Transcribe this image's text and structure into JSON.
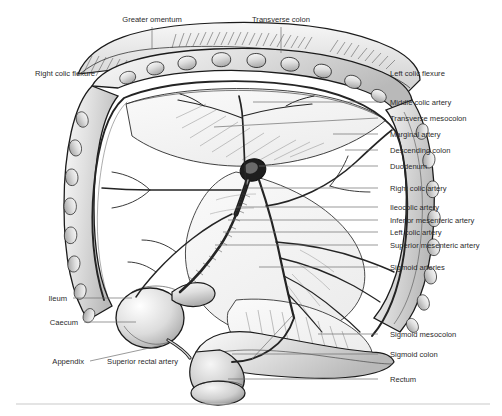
{
  "figure": {
    "type": "anatomical-illustration",
    "style": "black-and-white line drawing with grey wash shading",
    "footer_rule": true
  },
  "labels": {
    "top": [
      {
        "id": "greater-omentum",
        "text": "Greater omentum",
        "x": 152,
        "y": 22,
        "leader": {
          "x1": 152,
          "y1": 27,
          "x2": 152,
          "y2": 49
        }
      },
      {
        "id": "transverse-colon",
        "text": "Transverse colon",
        "x": 281,
        "y": 22,
        "leader": {
          "x1": 281,
          "y1": 27,
          "x2": 281,
          "y2": 53
        }
      }
    ],
    "left": [
      {
        "id": "right-colic-flexure",
        "text": "Right colic flexure",
        "x": 95,
        "y": 76,
        "leader": null
      },
      {
        "id": "ileum",
        "text": "Ileum",
        "x": 67,
        "y": 301,
        "leader": {
          "x1": 73,
          "y1": 298,
          "x2": 132,
          "y2": 298
        }
      },
      {
        "id": "caecum",
        "text": "Caecum",
        "x": 78,
        "y": 325,
        "leader": {
          "x1": 84,
          "y1": 322,
          "x2": 136,
          "y2": 322
        }
      },
      {
        "id": "appendix",
        "text": "Appendix",
        "x": 84,
        "y": 364,
        "leader": {
          "x1": 90,
          "y1": 361,
          "x2": 163,
          "y2": 345
        }
      },
      {
        "id": "superior-rectal-artery",
        "text": "Superior rectal artery",
        "x": 178,
        "y": 364,
        "leader": {
          "x1": 252,
          "y1": 359,
          "x2": 292,
          "y2": 316
        }
      }
    ],
    "right": [
      {
        "id": "left-colic-flexure",
        "text": "Left colic flexure",
        "x": 390,
        "y": 76,
        "leader": null
      },
      {
        "id": "middle-colic-artery",
        "text": "Middle colic artery",
        "x": 390,
        "y": 105,
        "leader": {
          "x1": 378,
          "y1": 102,
          "x2": 253,
          "y2": 102
        }
      },
      {
        "id": "transverse-mesocolon",
        "text": "Transverse mesocolon",
        "x": 390,
        "y": 121,
        "leader": {
          "x1": 378,
          "y1": 118,
          "x2": 214,
          "y2": 127
        }
      },
      {
        "id": "marginal-artery",
        "text": "Marginal artery",
        "x": 390,
        "y": 137,
        "leader": {
          "x1": 378,
          "y1": 134,
          "x2": 333,
          "y2": 134
        }
      },
      {
        "id": "descending-colon",
        "text": "Descending colon",
        "x": 390,
        "y": 153,
        "leader": {
          "x1": 378,
          "y1": 150,
          "x2": 345,
          "y2": 150
        }
      },
      {
        "id": "duodenum",
        "text": "Duodenum",
        "x": 390,
        "y": 169,
        "leader": {
          "x1": 378,
          "y1": 166,
          "x2": 259,
          "y2": 166
        }
      },
      {
        "id": "right-colic-artery",
        "text": "Right colic artery",
        "x": 390,
        "y": 191,
        "leader": {
          "x1": 378,
          "y1": 188,
          "x2": 248,
          "y2": 188
        }
      },
      {
        "id": "ileocolic-artery",
        "text": "Ileocolic artery",
        "x": 390,
        "y": 210,
        "leader": {
          "x1": 378,
          "y1": 207,
          "x2": 236,
          "y2": 207
        }
      },
      {
        "id": "inferior-mesenteric-artery",
        "text": "Inferior mesenteric artery",
        "x": 390,
        "y": 223,
        "leader": {
          "x1": 378,
          "y1": 220,
          "x2": 228,
          "y2": 220
        }
      },
      {
        "id": "left-colic-artery",
        "text": "Left colic artery",
        "x": 390,
        "y": 235,
        "leader": {
          "x1": 378,
          "y1": 232,
          "x2": 223,
          "y2": 232
        }
      },
      {
        "id": "superior-mesenteric-artery",
        "text": "Superior mesenteric artery",
        "x": 390,
        "y": 248,
        "leader": {
          "x1": 378,
          "y1": 245,
          "x2": 215,
          "y2": 245
        }
      },
      {
        "id": "sigmoid-arteries",
        "text": "Sigmoid arteries",
        "x": 390,
        "y": 270,
        "leader": {
          "x1": 378,
          "y1": 267,
          "x2": 259,
          "y2": 267
        }
      },
      {
        "id": "sigmoid-mesocolon",
        "text": "Sigmoid mesocolon",
        "x": 390,
        "y": 337,
        "leader": {
          "x1": 378,
          "y1": 334,
          "x2": 318,
          "y2": 334
        }
      },
      {
        "id": "sigmoid-colon",
        "text": "Sigmoid colon",
        "x": 390,
        "y": 357,
        "leader": {
          "x1": 378,
          "y1": 354,
          "x2": 232,
          "y2": 354
        }
      },
      {
        "id": "rectum",
        "text": "Rectum",
        "x": 390,
        "y": 382,
        "leader": {
          "x1": 378,
          "y1": 379,
          "x2": 228,
          "y2": 379
        }
      }
    ]
  },
  "colors": {
    "ink": "#1b1b1b",
    "leader": "#6e6e6e",
    "text": "#2b2b2b",
    "wash_light": "#ececec",
    "wash_mid": "#d6d6d6",
    "wash_dark": "#b4b4b4",
    "rule": "#c9c9c9",
    "background": "#ffffff"
  }
}
